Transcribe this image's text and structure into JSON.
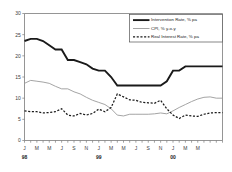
{
  "chart_data": {
    "type": "line",
    "title": "",
    "xlabel": "",
    "ylabel": "",
    "ylim": [
      0,
      30
    ],
    "yticks": [
      0,
      5,
      10,
      15,
      20,
      25,
      30
    ],
    "grid": false,
    "legend_position": "top-right",
    "x": [
      "1998-01",
      "1998-02",
      "1998-03",
      "1998-04",
      "1998-05",
      "1998-06",
      "1998-07",
      "1998-08",
      "1998-09",
      "1998-10",
      "1998-11",
      "1998-12",
      "1999-01",
      "1999-02",
      "1999-03",
      "1999-04",
      "1999-05",
      "1999-06",
      "1999-07",
      "1999-08",
      "1999-09",
      "1999-10",
      "1999-11",
      "1999-12",
      "2000-01",
      "2000-02",
      "2000-03",
      "2000-04",
      "2000-05",
      "2000-06",
      "2000-07",
      "2000-08",
      "2000-09"
    ],
    "xtick_labels": [
      "J",
      "",
      "M",
      "",
      "M",
      "",
      "J",
      "",
      "S",
      "",
      "N",
      "",
      "J",
      "",
      "M",
      "",
      "M",
      "",
      "J",
      "",
      "S",
      "",
      "N",
      "",
      "J",
      "",
      "M",
      "",
      "M",
      "",
      "",
      "",
      ""
    ],
    "year_labels": [
      {
        "label": "98",
        "x_index": 0
      },
      {
        "label": "99",
        "x_index": 12
      },
      {
        "label": "00",
        "x_index": 24
      }
    ],
    "series": [
      {
        "name": "Intervention Rate, % pa",
        "style": "solid-thick",
        "color": "#1a1a1a",
        "values": [
          23.5,
          24.0,
          24.0,
          23.5,
          22.5,
          21.5,
          21.5,
          19.0,
          19.0,
          18.5,
          18.0,
          17.0,
          16.5,
          16.5,
          15.0,
          13.0,
          13.0,
          13.0,
          13.0,
          13.0,
          13.0,
          13.0,
          13.0,
          14.0,
          16.5,
          16.5,
          17.5,
          17.5,
          17.5,
          17.5,
          17.5,
          17.5,
          17.5
        ]
      },
      {
        "name": "CPI, % y-o-y",
        "style": "solid-thin",
        "color": "#9a9a9a",
        "values": [
          13.5,
          14.2,
          14.0,
          13.8,
          13.5,
          12.8,
          12.2,
          12.2,
          11.5,
          11.0,
          10.2,
          9.5,
          9.0,
          8.5,
          7.5,
          6.0,
          5.8,
          6.2,
          6.2,
          6.2,
          6.2,
          6.3,
          6.5,
          6.3,
          7.0,
          7.8,
          8.5,
          9.2,
          9.8,
          10.2,
          10.3,
          10.0,
          10.0
        ]
      },
      {
        "name": "Real Interest Rate, % pa",
        "style": "dashed",
        "color": "#1a1a1a",
        "values": [
          7.0,
          6.8,
          6.8,
          6.5,
          6.6,
          6.8,
          7.5,
          6.0,
          5.8,
          6.4,
          6.0,
          6.4,
          7.4,
          6.8,
          7.8,
          11.0,
          10.3,
          9.6,
          9.5,
          9.0,
          8.9,
          8.8,
          9.5,
          7.5,
          6.0,
          5.2,
          6.0,
          5.8,
          5.7,
          6.2,
          6.5,
          6.6,
          6.6
        ]
      }
    ]
  },
  "legend": {
    "items": [
      {
        "label": "Intervention Rate, % pa",
        "style": "solid-thick"
      },
      {
        "label": "CPI, % y-o-y",
        "style": "solid-thin"
      },
      {
        "label": "Real Interest Rate, % pa",
        "style": "dashed"
      }
    ]
  }
}
